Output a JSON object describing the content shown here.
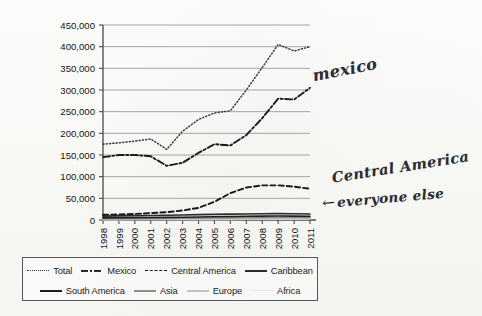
{
  "chart_data": {
    "type": "line",
    "title": "",
    "xlabel": "",
    "ylabel": "",
    "x": [
      "1998",
      "1999",
      "2000",
      "2001",
      "2002",
      "2003",
      "2004",
      "2005",
      "2006",
      "2007",
      "2008",
      "2009",
      "2010",
      "2011"
    ],
    "ylim": [
      0,
      450000
    ],
    "ytick_values": [
      0,
      50000,
      100000,
      150000,
      200000,
      250000,
      300000,
      350000,
      400000,
      450000
    ],
    "ytick_labels": [
      "0",
      "50,000",
      "100,000",
      "150,000",
      "200,000",
      "250,000",
      "300,000",
      "350,000",
      "400,000",
      "450,000"
    ],
    "grid": "horizontal",
    "legend_position": "bottom",
    "series": [
      {
        "name": "Total",
        "style": "dotted",
        "color": "#3a3a3a",
        "values": [
          175000,
          178000,
          182000,
          187000,
          163000,
          205000,
          232000,
          247000,
          252000,
          300000,
          352000,
          405000,
          390000,
          400000
        ]
      },
      {
        "name": "Mexico",
        "style": "dash-dot",
        "color": "#1b1b1b",
        "values": [
          145000,
          150000,
          150000,
          147000,
          125000,
          132000,
          155000,
          175000,
          172000,
          196000,
          235000,
          280000,
          278000,
          305000
        ]
      },
      {
        "name": "Central America",
        "style": "dashed",
        "color": "#181818",
        "values": [
          12000,
          13000,
          14000,
          16000,
          18000,
          22000,
          28000,
          42000,
          62000,
          75000,
          80000,
          80000,
          77000,
          72000
        ]
      },
      {
        "name": "Caribbean",
        "style": "solid",
        "color": "#2b2b2b",
        "values": [
          9000,
          9500,
          10000,
          10500,
          11000,
          11500,
          12500,
          13000,
          13500,
          14000,
          14500,
          15000,
          14500,
          14000
        ]
      },
      {
        "name": "South America",
        "style": "solid",
        "color": "#1d1d1d",
        "values": [
          5000,
          5200,
          5500,
          5800,
          6000,
          6500,
          7000,
          7500,
          8000,
          8500,
          9000,
          9200,
          9000,
          8800
        ]
      },
      {
        "name": "Asia",
        "style": "solid",
        "color": "#8d8d8d",
        "values": [
          3000,
          3200,
          3400,
          3600,
          3800,
          4000,
          4300,
          4600,
          4900,
          5200,
          5500,
          5700,
          5600,
          5400
        ]
      },
      {
        "name": "Europe",
        "style": "solid",
        "color": "#c2c2c2",
        "values": [
          1800,
          1900,
          2000,
          2100,
          2200,
          2300,
          2400,
          2500,
          2600,
          2700,
          2800,
          2900,
          2800,
          2700
        ]
      },
      {
        "name": "Africa",
        "style": "solid",
        "color": "#e4e4e4",
        "values": [
          900,
          950,
          1000,
          1050,
          1100,
          1200,
          1300,
          1400,
          1500,
          1600,
          1700,
          1800,
          1750,
          1700
        ]
      }
    ]
  },
  "legend": {
    "row1": [
      {
        "label": "Total",
        "style": "dotted"
      },
      {
        "label": "Mexico",
        "style": "dash-dot"
      },
      {
        "label": "Central America",
        "style": "dashed"
      },
      {
        "label": "Caribbean",
        "style": "solid"
      }
    ],
    "row2": [
      {
        "label": "South America",
        "style": "solid-dark"
      },
      {
        "label": "Asia",
        "style": "gray"
      },
      {
        "label": "Europe",
        "style": "light"
      },
      {
        "label": "Africa",
        "style": "faint"
      }
    ]
  },
  "annotations": {
    "mexico": "mexico",
    "central_america": "Central America",
    "everyone_else": "everyone else",
    "arrow_glyph": "←"
  }
}
